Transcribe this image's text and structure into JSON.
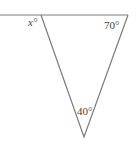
{
  "diagram": {
    "type": "geometry-triangle-angles",
    "labels": {
      "top_left_exterior": "x°",
      "top_right": "70°",
      "bottom": "40°"
    },
    "angles": {
      "x": "unknown",
      "top_right_deg": 70,
      "bottom_deg": 40
    },
    "colors": {
      "line": "#7a7a7a",
      "text": "#444444",
      "background": "#ffffff"
    }
  }
}
